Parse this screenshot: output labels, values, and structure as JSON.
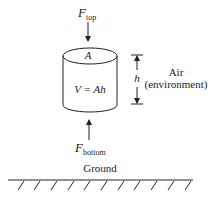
{
  "diagram": {
    "force_top": {
      "symbol": "F",
      "subscript": "top"
    },
    "force_bottom": {
      "symbol": "F",
      "subscript": "bottom"
    },
    "cylinder": {
      "area_label": "A",
      "volume_label": "V = Ah"
    },
    "height_label": "h",
    "environment": {
      "line1": "Air",
      "line2": "(environment)"
    },
    "ground_label": "Ground",
    "colors": {
      "stroke": "#222222",
      "background": "#ffffff"
    }
  }
}
